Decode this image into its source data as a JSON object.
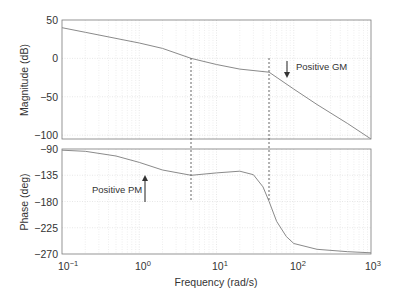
{
  "chart_data": [
    {
      "type": "line",
      "title": "",
      "xlabel": "",
      "ylabel": "Magnitude (dB)",
      "xscale": "log",
      "xlim": [
        0.1,
        1000
      ],
      "ylim": [
        -105,
        50
      ],
      "yticks": [
        50,
        0,
        -50,
        -100
      ],
      "ytick_labels": [
        "50",
        "0",
        "−50",
        "−100"
      ],
      "grid": true,
      "series": [
        {
          "name": "Magnitude",
          "x": [
            0.1,
            0.2,
            0.5,
            1,
            2,
            4.7,
            10,
            20,
            48,
            100,
            200,
            500,
            1000
          ],
          "y": [
            40,
            34,
            26,
            20,
            13,
            0,
            -8,
            -14,
            -18,
            -40,
            -60,
            -85,
            -105
          ]
        }
      ],
      "annotations": [
        {
          "text": "Positive GM",
          "arrow": "down",
          "x": 80,
          "y_from": 13,
          "y_to": -6
        }
      ],
      "markers": [
        {
          "type": "vline-dashed",
          "x": 4.7,
          "label": "gain crossover"
        },
        {
          "type": "vline-dashed",
          "x": 48,
          "label": "phase crossover"
        }
      ]
    },
    {
      "type": "line",
      "title": "",
      "xlabel": "Frequency (rad/s)",
      "ylabel": "Phase (deg)",
      "xscale": "log",
      "xlim": [
        0.1,
        1000
      ],
      "ylim": [
        -270,
        -90
      ],
      "yticks": [
        -90,
        -135,
        -180,
        -225,
        -270
      ],
      "ytick_labels": [
        "−90",
        "−135",
        "−180",
        "−225",
        "−270"
      ],
      "xticks": [
        0.1,
        1,
        10,
        100,
        1000
      ],
      "xtick_labels": [
        {
          "base": "10",
          "exp": "−1"
        },
        {
          "base": "10",
          "exp": "0"
        },
        {
          "base": "10",
          "exp": "1"
        },
        {
          "base": "10",
          "exp": "2"
        },
        {
          "base": "10",
          "exp": "3"
        }
      ],
      "grid": true,
      "series": [
        {
          "name": "Phase",
          "x": [
            0.1,
            0.2,
            0.5,
            1,
            2,
            4.7,
            10,
            20,
            30,
            40,
            48,
            60,
            80,
            100,
            200,
            500,
            1000
          ],
          "y": [
            -92,
            -94,
            -102,
            -113,
            -126,
            -135,
            -131,
            -128,
            -134,
            -155,
            -180,
            -214,
            -240,
            -252,
            -262,
            -266,
            -268
          ]
        }
      ],
      "annotations": [
        {
          "text": "Positive PM",
          "arrow": "up",
          "x": 1.1,
          "y_from": -180,
          "y_to": -135
        }
      ],
      "markers": [
        {
          "type": "vline-dashed",
          "x": 4.7
        },
        {
          "type": "vline-dashed",
          "x": 48
        }
      ]
    }
  ],
  "labels": {
    "mag_ylabel": "Magnitude (dB)",
    "phase_ylabel": "Phase (deg)",
    "xlabel": "Frequency (rad/s)",
    "gm_text": "Positive GM",
    "pm_text": "Positive PM",
    "mag_ticks": [
      "50",
      "0",
      "−50",
      "−100"
    ],
    "phase_ticks": [
      "−90",
      "−135",
      "−180",
      "−225",
      "−270"
    ],
    "x_base": "10",
    "x_exps": [
      "−1",
      "0",
      "1",
      "2",
      "3"
    ]
  },
  "colors": {
    "curve": "#8a8a8a",
    "axis": "#7a7a7a",
    "grid": "#dcdcdc",
    "text": "#333333"
  }
}
